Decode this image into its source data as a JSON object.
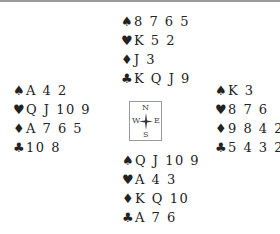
{
  "diagram": {
    "type": "bridge-deal",
    "compass": {
      "north": "N",
      "south": "S",
      "east": "E",
      "west": "W"
    },
    "suit_symbols": {
      "spades": "♠",
      "hearts": "♥",
      "diamonds": "♦",
      "clubs": "♣"
    },
    "hands": {
      "north": {
        "spades": "8 7 6 5",
        "hearts": "K 5 2",
        "diamonds": "J 3",
        "clubs": "K Q J 9"
      },
      "west": {
        "spades": "A 4 2",
        "hearts": "Q J 10 9",
        "diamonds": "A 7 6 5",
        "clubs": "10 8"
      },
      "east": {
        "spades": "K 3",
        "hearts": "8 7 6",
        "diamonds": "9 8 4 2",
        "clubs": "5 4 3 2"
      },
      "south": {
        "spades": "Q J 10 9",
        "hearts": "A 4 3",
        "diamonds": "K Q 10",
        "clubs": "A 7 6"
      }
    }
  }
}
